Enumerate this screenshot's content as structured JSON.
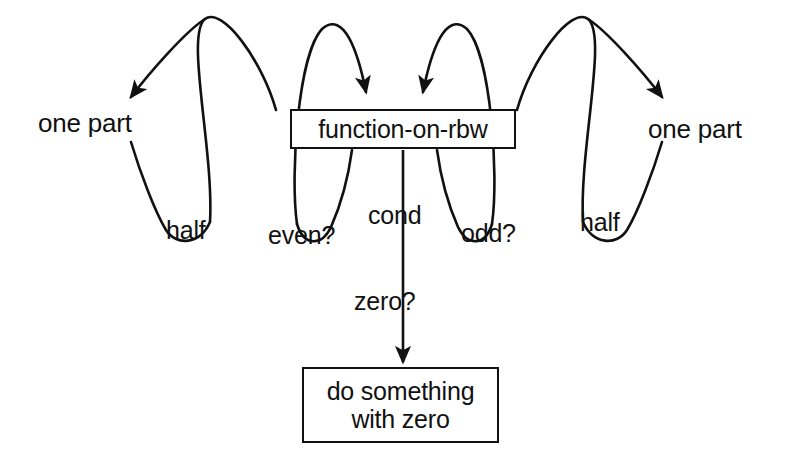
{
  "diagram": {
    "background_color": "#ffffff",
    "stroke_color": "#111111",
    "nodes": [
      {
        "id": "one-part-left",
        "label": "one part",
        "shape": "text"
      },
      {
        "id": "function",
        "label": "function-on-rbw",
        "shape": "box"
      },
      {
        "id": "one-part-right",
        "label": "one part",
        "shape": "text"
      },
      {
        "id": "do-zero",
        "label_line1": "do something",
        "label_line2": "with zero",
        "shape": "box"
      }
    ],
    "edge_labels": {
      "half_left": "half",
      "even": "even?",
      "cond": "cond",
      "odd": "odd?",
      "half_right": "half",
      "zero": "zero?"
    },
    "edges": [
      {
        "id": "edge-function-to-one-part-left",
        "from": "function",
        "to": "one-part-left",
        "label": "half",
        "arrow": true
      },
      {
        "id": "edge-one-part-left-to-function",
        "from": "one-part-left",
        "to": "function",
        "label": "even?",
        "arrow": true
      },
      {
        "id": "edge-one-part-right-to-function",
        "from": "one-part-right",
        "to": "function",
        "label": "odd?",
        "arrow": true
      },
      {
        "id": "edge-function-to-one-part-right",
        "from": "function",
        "to": "one-part-right",
        "label": "half",
        "arrow": true
      },
      {
        "id": "edge-function-to-do-zero",
        "from": "function",
        "to": "do-zero",
        "label": "zero?",
        "arrow": true
      }
    ]
  }
}
